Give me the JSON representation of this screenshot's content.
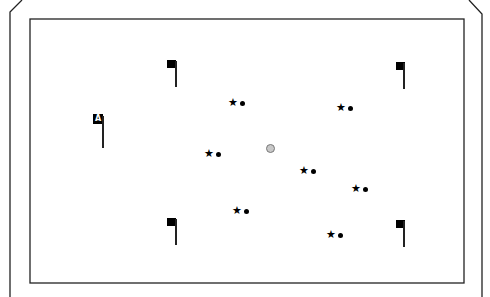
{
  "scene": {
    "type": "top-down field",
    "colors": {
      "background": "#ffffff",
      "lines": "#222222",
      "objects": "#000000",
      "ball": "#c8c8c8"
    }
  },
  "labeled_flag": {
    "label": "A",
    "x": 93,
    "y": 114
  },
  "flags": [
    {
      "id": "flag-top-left",
      "x": 167,
      "y": 60
    },
    {
      "id": "flag-top-right",
      "x": 396,
      "y": 62
    },
    {
      "id": "flag-bottom-left",
      "x": 167,
      "y": 218
    },
    {
      "id": "flag-bottom-right",
      "x": 396,
      "y": 220
    }
  ],
  "markers": [
    {
      "star": "★",
      "x": 228,
      "y": 97
    },
    {
      "star": "★",
      "x": 336,
      "y": 102
    },
    {
      "star": "★",
      "x": 204,
      "y": 148
    },
    {
      "star": "★",
      "x": 299,
      "y": 165
    },
    {
      "star": "★",
      "x": 351,
      "y": 183
    },
    {
      "star": "★",
      "x": 232,
      "y": 205
    },
    {
      "star": "★",
      "x": 326,
      "y": 229
    }
  ],
  "ball": {
    "x": 266,
    "y": 144
  }
}
